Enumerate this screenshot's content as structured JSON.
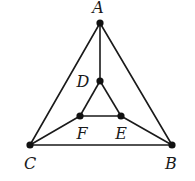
{
  "diagram": {
    "type": "graph",
    "colors": {
      "edge": "#1a1a1a",
      "node": "#111111",
      "background": "#ffffff"
    },
    "nodes": [
      {
        "id": "A",
        "label": "A",
        "x": 100,
        "y": 23,
        "lx": 98,
        "ly": 13
      },
      {
        "id": "B",
        "label": "B",
        "x": 172,
        "y": 145,
        "lx": 171,
        "ly": 169
      },
      {
        "id": "C",
        "label": "C",
        "x": 30,
        "y": 145,
        "lx": 30,
        "ly": 169
      },
      {
        "id": "D",
        "label": "D",
        "x": 100,
        "y": 81,
        "lx": 83,
        "ly": 87
      },
      {
        "id": "E",
        "label": "E",
        "x": 121,
        "y": 116,
        "lx": 121,
        "ly": 139
      },
      {
        "id": "F",
        "label": "F",
        "x": 80,
        "y": 116,
        "lx": 82,
        "ly": 139
      }
    ],
    "edges": [
      [
        "A",
        "B"
      ],
      [
        "A",
        "C"
      ],
      [
        "B",
        "C"
      ],
      [
        "A",
        "D"
      ],
      [
        "D",
        "E"
      ],
      [
        "D",
        "F"
      ],
      [
        "E",
        "F"
      ],
      [
        "C",
        "F"
      ],
      [
        "B",
        "E"
      ]
    ]
  }
}
